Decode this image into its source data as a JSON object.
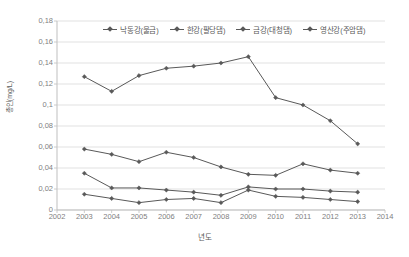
{
  "chart_data": {
    "type": "line",
    "title": "",
    "xlabel": "년도",
    "ylabel": "총인(mg/L)",
    "xlim": [
      2002,
      2014
    ],
    "ylim": [
      0,
      0.18
    ],
    "ytick_step": 0.02,
    "grid": true,
    "legend_position": "top-center",
    "marker": "diamond",
    "series_color": "#595959",
    "x": [
      2003,
      2004,
      2005,
      2006,
      2007,
      2008,
      2009,
      2010,
      2011,
      2012,
      2013
    ],
    "xticks": [
      "2002",
      "2003",
      "2004",
      "2005",
      "2006",
      "2007",
      "2008",
      "2009",
      "2010",
      "2011",
      "2012",
      "2013",
      "2014"
    ],
    "yticks": [
      "0",
      "0,02",
      "0,04",
      "0,06",
      "0,08",
      "0,1",
      "0,12",
      "0,14",
      "0,16",
      "0,18"
    ],
    "ytick_values": [
      0,
      0.02,
      0.04,
      0.06,
      0.08,
      0.1,
      0.12,
      0.14,
      0.16,
      0.18
    ],
    "series": [
      {
        "name": "낙동강(물금)",
        "values": [
          0.127,
          0.113,
          0.128,
          0.135,
          0.137,
          0.14,
          0.146,
          0.107,
          0.1,
          0.085,
          0.063
        ]
      },
      {
        "name": "한강(팔당댐)",
        "values": [
          0.058,
          0.053,
          0.046,
          0.055,
          0.05,
          0.041,
          0.034,
          0.033,
          0.044,
          0.038,
          0.035
        ]
      },
      {
        "name": "금강(대청댐)",
        "values": [
          0.035,
          0.021,
          0.021,
          0.019,
          0.017,
          0.014,
          0.022,
          0.02,
          0.02,
          0.018,
          0.017
        ]
      },
      {
        "name": "영산강(주암댐)",
        "values": [
          0.015,
          0.011,
          0.007,
          0.01,
          0.011,
          0.007,
          0.019,
          0.013,
          0.012,
          0.01,
          0.008
        ]
      }
    ]
  }
}
